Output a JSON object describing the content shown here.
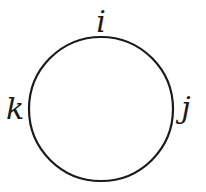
{
  "diagram": {
    "circle": {
      "cx": 101,
      "cy": 109,
      "r": 72,
      "stroke": "#1a1a1a",
      "stroke_width": 2.2
    },
    "labels": [
      {
        "id": "i",
        "text": "i",
        "x": 101,
        "y": 32
      },
      {
        "id": "j",
        "text": "j",
        "x": 186,
        "y": 118
      },
      {
        "id": "k",
        "text": "k",
        "x": 15,
        "y": 119
      }
    ]
  }
}
